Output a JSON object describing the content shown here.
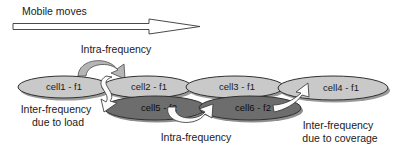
{
  "diagram": {
    "title": "Mobile moves",
    "colors": {
      "cell_f1_fill": "#c9c9c9",
      "cell_f2_fill": "#6d6d6d",
      "cell_stroke": "#303030",
      "shadow": "#9a9a9a",
      "arc_arrow_fill": "#b5b5b5",
      "white_arrow_fill": "#fbfbfb",
      "outline_arrow_fill": "#ffffff",
      "text": "#1a1a1a",
      "background": "#ffffff"
    },
    "mobile_arrow": {
      "label": "Mobile moves",
      "direction": "right",
      "style": "hollow-outline"
    },
    "cells": [
      {
        "id": "cell1",
        "label": "cell1 - f1",
        "frequency": "f1",
        "layer": "upper",
        "cx": 64,
        "cy": 87,
        "rx": 46,
        "ry": 11
      },
      {
        "id": "cell2",
        "label": "cell2 - f1",
        "frequency": "f1",
        "layer": "upper",
        "cx": 147,
        "cy": 87,
        "rx": 45,
        "ry": 11
      },
      {
        "id": "cell3",
        "label": "cell3 - f1",
        "frequency": "f1",
        "layer": "upper",
        "cx": 235,
        "cy": 87,
        "rx": 49,
        "ry": 11
      },
      {
        "id": "cell4",
        "label": "cell4 - f1",
        "frequency": "f1",
        "layer": "upper",
        "cx": 333,
        "cy": 88,
        "rx": 55,
        "ry": 12
      },
      {
        "id": "cell5",
        "label": "cell5 - f2",
        "frequency": "f2",
        "layer": "lower",
        "cx": 155,
        "cy": 108,
        "rx": 51,
        "ry": 12
      },
      {
        "id": "cell6",
        "label": "cell6 - f2",
        "frequency": "f2",
        "layer": "lower",
        "cx": 250,
        "cy": 108,
        "rx": 51,
        "ry": 12
      }
    ],
    "annotations": [
      {
        "id": "intra-top",
        "lines": [
          "Intra-frequency"
        ],
        "x": 116,
        "y": 50
      },
      {
        "id": "inter-load",
        "lines": [
          "Inter-frequency",
          "due to load"
        ],
        "x": 56,
        "y": 110
      },
      {
        "id": "intra-bottom",
        "lines": [
          "Intra-frequency"
        ],
        "x": 196,
        "y": 138
      },
      {
        "id": "inter-cover",
        "lines": [
          "Inter-frequency",
          "due to coverage"
        ],
        "x": 338,
        "y": 126
      }
    ],
    "handover_arrows": [
      {
        "id": "intra-frequency-top",
        "from": "cell1",
        "to": "cell2",
        "style": "grey-arc"
      },
      {
        "id": "inter-frequency-due-to-load",
        "from": "cell2",
        "to": "cell5",
        "style": "white-s-curve"
      },
      {
        "id": "intra-frequency-bottom",
        "from": "cell5",
        "to": "cell6",
        "style": "white-u-curve"
      },
      {
        "id": "inter-frequency-due-to-coverage",
        "from": "cell6",
        "to": "cell4",
        "style": "white-curve"
      }
    ]
  }
}
